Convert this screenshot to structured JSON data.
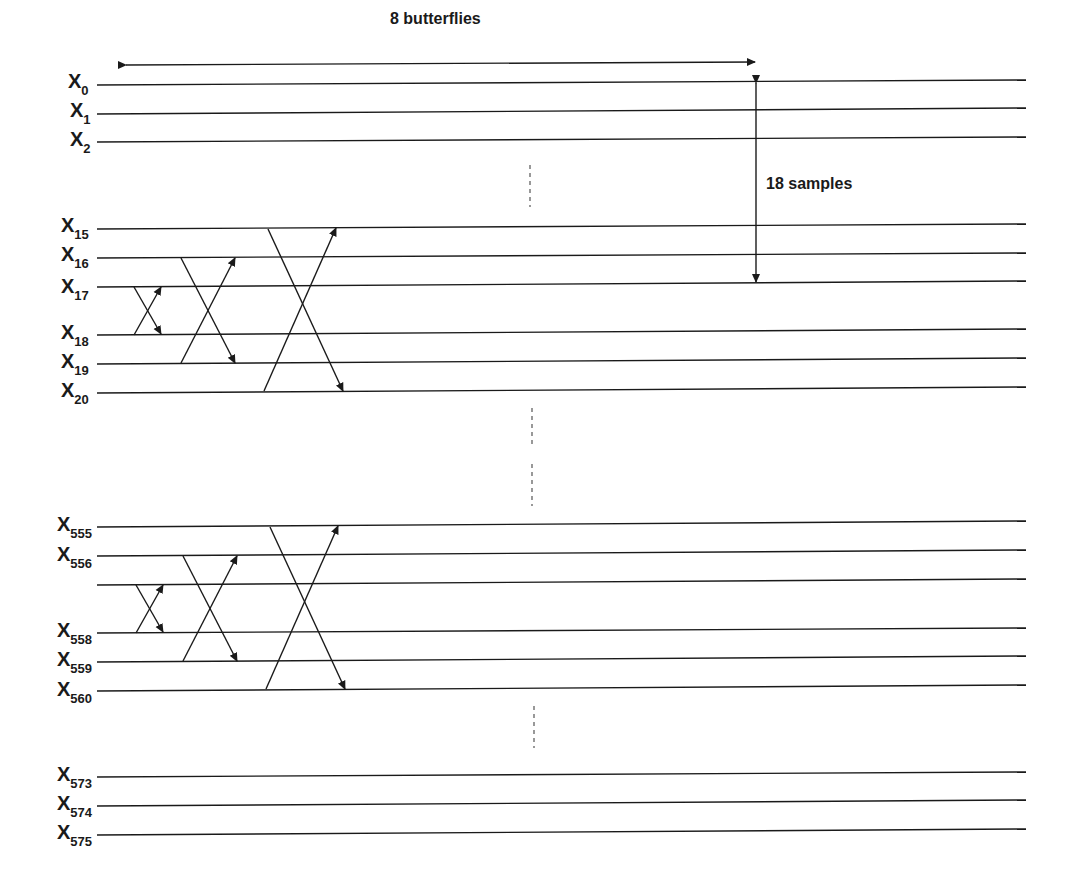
{
  "diagram": {
    "top_annotation": "8 butterflies",
    "right_annotation": "18 samples",
    "colors": {
      "line": "#1a1a1a",
      "background": "#ffffff"
    },
    "sample_labels": [
      {
        "base": "X",
        "sub": "0"
      },
      {
        "base": "X",
        "sub": "1"
      },
      {
        "base": "X",
        "sub": "2"
      },
      {
        "base": "X",
        "sub": "15"
      },
      {
        "base": "X",
        "sub": "16"
      },
      {
        "base": "X",
        "sub": "17"
      },
      {
        "base": "X",
        "sub": "18"
      },
      {
        "base": "X",
        "sub": "19"
      },
      {
        "base": "X",
        "sub": "20"
      },
      {
        "base": "X",
        "sub": "555"
      },
      {
        "base": "X",
        "sub": "556"
      },
      {
        "base": "X",
        "sub": "558"
      },
      {
        "base": "X",
        "sub": "559"
      },
      {
        "base": "X",
        "sub": "560"
      },
      {
        "base": "X",
        "sub": "573"
      },
      {
        "base": "X",
        "sub": "574"
      },
      {
        "base": "X",
        "sub": "575"
      }
    ],
    "groups": [
      {
        "name": "group-1",
        "samples": [
          "X15",
          "X16",
          "X17",
          "X18",
          "X19",
          "X20"
        ],
        "butterflies": [
          "X17-X18",
          "X16-X19",
          "X15-X20"
        ]
      },
      {
        "name": "group-2",
        "samples": [
          "X555",
          "X556",
          "(unlabeled)",
          "X558",
          "X559",
          "X560"
        ],
        "butterflies": [
          "row3-X558",
          "X556-X559",
          "X555-X560"
        ]
      }
    ]
  }
}
